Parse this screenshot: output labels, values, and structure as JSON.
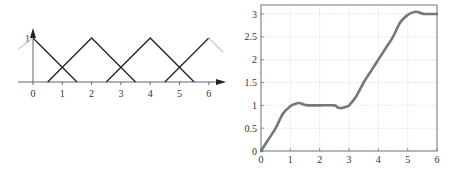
{
  "chart_data": [
    {
      "type": "line",
      "title": "Triangular membership functions",
      "xlabel": "",
      "ylabel": "",
      "x_ticks": [
        "0",
        "1",
        "2",
        "3",
        "4",
        "5",
        "6"
      ],
      "y_ticks": [
        "1"
      ],
      "xlim": [
        -0.5,
        6.5
      ],
      "ylim": [
        0,
        1
      ],
      "grid": false,
      "axes_style": "arrows",
      "series": [
        {
          "name": "mf_0",
          "x": [
            -0.5,
            0,
            1.5
          ],
          "y": [
            0.75,
            1,
            0
          ],
          "color": "#222222",
          "faded_left": true
        },
        {
          "name": "mf_2",
          "x": [
            0.5,
            2,
            3.5
          ],
          "y": [
            0,
            1,
            0
          ],
          "color": "#222222"
        },
        {
          "name": "mf_4",
          "x": [
            2.5,
            4,
            5.5
          ],
          "y": [
            0,
            1,
            0
          ],
          "color": "#222222"
        },
        {
          "name": "mf_6",
          "x": [
            4.5,
            6,
            6.5
          ],
          "y": [
            0,
            1,
            0.67
          ],
          "color": "#222222",
          "faded_right": true
        }
      ]
    },
    {
      "type": "line",
      "title": "",
      "xlabel": "",
      "ylabel": "",
      "x_ticks": [
        "0",
        "1",
        "2",
        "3",
        "4",
        "5",
        "6"
      ],
      "y_ticks": [
        "0",
        "0.5",
        "1",
        "1.5",
        "2",
        "2.5",
        "3"
      ],
      "xlim": [
        0,
        6
      ],
      "ylim": [
        0,
        3.2
      ],
      "grid": true,
      "series": [
        {
          "name": "output",
          "color": "#777777",
          "x": [
            0,
            0.25,
            0.5,
            0.75,
            1.0,
            1.15,
            1.3,
            1.45,
            1.6,
            2.0,
            2.5,
            2.6,
            2.75,
            2.9,
            3.0,
            3.25,
            3.5,
            3.75,
            4.0,
            4.25,
            4.5,
            4.75,
            5.0,
            5.15,
            5.3,
            5.45,
            5.6,
            6.0
          ],
          "y": [
            0,
            0.25,
            0.5,
            0.82,
            0.98,
            1.03,
            1.05,
            1.02,
            1.0,
            1.0,
            1.0,
            0.96,
            0.94,
            0.97,
            1.0,
            1.2,
            1.5,
            1.75,
            2.0,
            2.25,
            2.5,
            2.82,
            2.98,
            3.03,
            3.05,
            3.02,
            3.0,
            3.0
          ]
        }
      ]
    }
  ]
}
